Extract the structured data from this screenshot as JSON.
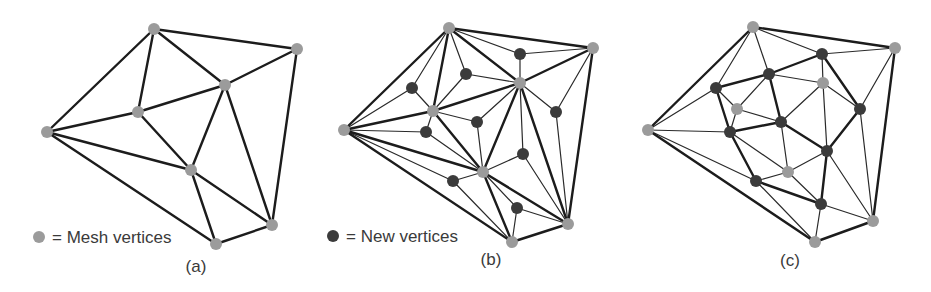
{
  "colors": {
    "mesh_vertex": "#9b9b9b",
    "new_vertex": "#3b3b3b",
    "edge": "#1c1c1c"
  },
  "legend": {
    "mesh": {
      "label": "= Mesh vertices",
      "dot": [
        39,
        237
      ],
      "text": [
        52,
        243
      ]
    },
    "new": {
      "label": "= New vertices",
      "dot": [
        333,
        236
      ],
      "text": [
        346,
        242
      ]
    }
  },
  "panels": [
    {
      "caption": "(a)",
      "caption_pos": [
        196,
        272
      ],
      "mesh_vertices": [
        [
          154,
          29
        ],
        [
          297,
          49
        ],
        [
          225,
          85
        ],
        [
          138,
          112
        ],
        [
          47,
          132
        ],
        [
          191,
          170
        ],
        [
          272,
          225
        ],
        [
          216,
          244
        ]
      ],
      "new_vertices": [],
      "thick_edges": [
        [
          0,
          1
        ],
        [
          0,
          2
        ],
        [
          0,
          3
        ],
        [
          0,
          4
        ],
        [
          1,
          2
        ],
        [
          1,
          6
        ],
        [
          2,
          3
        ],
        [
          2,
          5
        ],
        [
          2,
          6
        ],
        [
          3,
          4
        ],
        [
          3,
          5
        ],
        [
          4,
          5
        ],
        [
          4,
          7
        ],
        [
          5,
          7
        ],
        [
          5,
          6
        ],
        [
          7,
          6
        ]
      ],
      "thin_edges": [],
      "dual_thick_edges": []
    },
    {
      "caption": "(b)",
      "caption_pos": [
        491,
        265
      ],
      "mesh_vertices": [
        [
          449,
          28
        ],
        [
          593,
          48
        ],
        [
          520,
          83
        ],
        [
          433,
          111
        ],
        [
          344,
          130
        ],
        [
          483,
          172
        ],
        [
          568,
          224
        ],
        [
          512,
          242
        ]
      ],
      "new_vertices": [
        [
          520,
          54
        ],
        [
          466,
          74
        ],
        [
          412,
          88
        ],
        [
          556,
          112
        ],
        [
          477,
          122
        ],
        [
          426,
          132
        ],
        [
          523,
          154
        ],
        [
          453,
          181
        ],
        [
          517,
          208
        ]
      ],
      "triangles": [
        [
          0,
          1,
          2
        ],
        [
          0,
          2,
          3
        ],
        [
          0,
          3,
          4
        ],
        [
          1,
          2,
          6
        ],
        [
          2,
          3,
          5
        ],
        [
          3,
          4,
          5
        ],
        [
          2,
          5,
          6
        ],
        [
          4,
          5,
          7
        ],
        [
          5,
          7,
          6
        ]
      ],
      "thick_edges": [
        [
          0,
          1
        ],
        [
          0,
          2
        ],
        [
          0,
          3
        ],
        [
          0,
          4
        ],
        [
          1,
          2
        ],
        [
          1,
          6
        ],
        [
          2,
          3
        ],
        [
          2,
          5
        ],
        [
          2,
          6
        ],
        [
          3,
          4
        ],
        [
          3,
          5
        ],
        [
          4,
          5
        ],
        [
          4,
          7
        ],
        [
          5,
          7
        ],
        [
          5,
          6
        ],
        [
          7,
          6
        ]
      ],
      "dual_thick_edges": []
    },
    {
      "caption": "(c)",
      "caption_pos": [
        790,
        266
      ],
      "mesh_vertices": [
        [
          753,
          27
        ],
        [
          895,
          48
        ],
        [
          823,
          83
        ],
        [
          737,
          109
        ],
        [
          648,
          130
        ],
        [
          788,
          172
        ],
        [
          873,
          221
        ],
        [
          815,
          242
        ]
      ],
      "new_vertices": [
        [
          822,
          54
        ],
        [
          769,
          74
        ],
        [
          716,
          88
        ],
        [
          860,
          109
        ],
        [
          781,
          122
        ],
        [
          730,
          132
        ],
        [
          827,
          151
        ],
        [
          756,
          181
        ],
        [
          821,
          204
        ]
      ],
      "triangles": [
        [
          0,
          1,
          2
        ],
        [
          0,
          2,
          3
        ],
        [
          0,
          3,
          4
        ],
        [
          1,
          2,
          6
        ],
        [
          2,
          3,
          5
        ],
        [
          3,
          4,
          5
        ],
        [
          2,
          5,
          6
        ],
        [
          4,
          5,
          7
        ],
        [
          5,
          7,
          6
        ]
      ],
      "thick_edges": [
        [
          0,
          1
        ],
        [
          1,
          6
        ],
        [
          6,
          7
        ],
        [
          7,
          4
        ],
        [
          4,
          0
        ]
      ],
      "dual_thick_edges": [
        [
          0,
          1
        ],
        [
          0,
          3
        ],
        [
          1,
          2
        ],
        [
          1,
          4
        ],
        [
          2,
          5
        ],
        [
          3,
          6
        ],
        [
          4,
          5
        ],
        [
          4,
          6
        ],
        [
          5,
          7
        ],
        [
          6,
          8
        ],
        [
          7,
          8
        ]
      ]
    }
  ]
}
